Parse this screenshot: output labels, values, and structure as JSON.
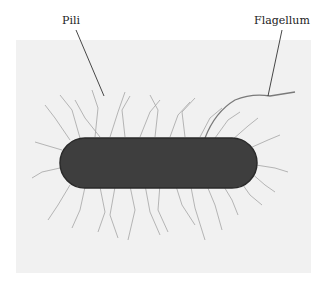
{
  "figure": {
    "labels": {
      "pili": "Pili",
      "flagellum": "Flagellum"
    },
    "colors": {
      "background": "#f1f1f1",
      "cell_body": "#3e3e3e",
      "pili": "#8a8a8a",
      "leader_line": "#333333"
    }
  }
}
